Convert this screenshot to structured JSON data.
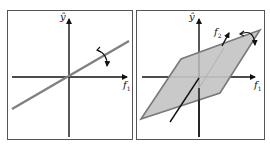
{
  "figure": {
    "left_panel": {
      "y_axis_label": "ŷ",
      "x_axis_label": "f",
      "x_axis_subscript": "1",
      "description": "regression line through origin with rotation arrow"
    },
    "right_panel": {
      "y_axis_label": "ŷ",
      "x_axis_label": "f",
      "x_axis_subscript": "1",
      "z_axis_label": "f",
      "z_axis_subscript": "2",
      "description": "regression plane (parallelogram) with rotation arrow"
    },
    "colors": {
      "axis": "#111111",
      "line": "#808080",
      "plane_fill": "#c4c4c4",
      "plane_edge": "#7a7a7a",
      "border": "#555555"
    }
  }
}
